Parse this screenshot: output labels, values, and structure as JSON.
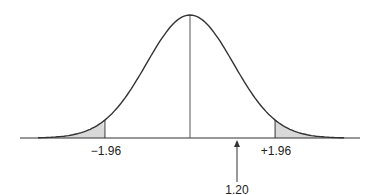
{
  "chart_data": {
    "type": "area",
    "title": "",
    "xlabel": "",
    "ylabel": "",
    "distribution": {
      "mean": 0,
      "sd": 1
    },
    "critical_values": [
      -1.96,
      1.96
    ],
    "critical_labels": [
      "−1.96",
      "+1.96"
    ],
    "shaded_regions": [
      {
        "from": "-inf",
        "to": -1.96,
        "color": "#d9d9d9"
      },
      {
        "from": 1.96,
        "to": "inf",
        "color": "#d9d9d9"
      }
    ],
    "mean_line": true,
    "marker": {
      "value": 1.2,
      "label": "1.20",
      "style": "arrow-up"
    },
    "grid": false,
    "legend": null
  },
  "colors": {
    "curve": "#333333",
    "shade": "#d9d9d9",
    "axis": "#333333"
  }
}
